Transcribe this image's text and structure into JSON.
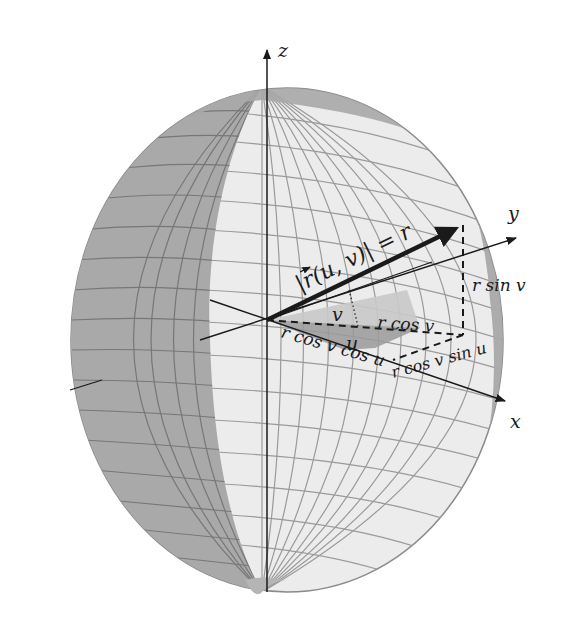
{
  "figure": {
    "axes": {
      "x_label": "x",
      "y_label": "y",
      "z_label": "z"
    },
    "vector_label": "|r⃗(u, v)| = r",
    "vector_label_parts": {
      "open": "|",
      "r": "r",
      "args": "(u, v)",
      "close": "| = r"
    },
    "angles": {
      "v": "v",
      "u": "u"
    },
    "components": {
      "r_cos_v": "r cos v",
      "r_sin_v": "r sin v",
      "r_cos_v_cos_u": "r cos v cos u",
      "r_cos_v_sin_u": "r cos v sin u"
    },
    "colors": {
      "sphere_light": "#ececec",
      "sphere_dark": "#a8a8a8",
      "grid": "#8e8e8e",
      "axis": "#1a1a1a",
      "angle_v_fill": "#c9c9c9",
      "angle_u_fill": "#9a9a9a"
    }
  }
}
